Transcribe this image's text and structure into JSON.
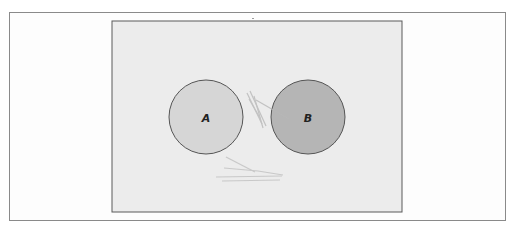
{
  "diagram": {
    "type": "two-circle diagram",
    "panel": {
      "background": "#ececec",
      "border": "#5a5a5a"
    },
    "circles": [
      {
        "label": "A",
        "fill": "#d6d6d6",
        "stroke": "#555555"
      },
      {
        "label": "B",
        "fill": "#b5b5b5",
        "stroke": "#555555"
      }
    ],
    "annotations": [
      "pencil scribble between circles",
      "pencil scribble below circles"
    ]
  }
}
